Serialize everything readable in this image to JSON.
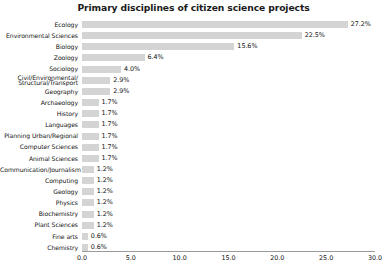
{
  "chart_data": {
    "type": "bar",
    "orientation": "horizontal",
    "title": "Primary disciplines of citizen science projects",
    "xlabel": "",
    "ylabel": "",
    "xlim": [
      0.0,
      30.0
    ],
    "xticks": [
      "0.0",
      "5.0",
      "10.0",
      "15.0",
      "20.0",
      "25.0",
      "30.0"
    ],
    "xtick_values": [
      0,
      5,
      10,
      15,
      20,
      25,
      30
    ],
    "grid": false,
    "legend": "none",
    "bar_color": "#d4d4d4",
    "categories": [
      "Ecology",
      "Environmental Sciences",
      "Biology",
      "Zoology",
      "Sociology",
      "Civil/Environmental/\nStructural/Transport",
      "Geography",
      "Archaeology",
      "History",
      "Languages",
      "Planning Urban/Regional",
      "Computer Sciences",
      "Animal Sciences",
      "Communication/Journalism",
      "Computing",
      "Geology",
      "Physics",
      "Biochemistry",
      "Plant Sciences",
      "Fine arts",
      "Chemistry"
    ],
    "values": [
      27.2,
      22.5,
      15.6,
      6.4,
      4.0,
      2.9,
      2.9,
      1.7,
      1.7,
      1.7,
      1.7,
      1.7,
      1.7,
      1.2,
      1.2,
      1.2,
      1.2,
      1.2,
      1.2,
      0.6,
      0.6
    ],
    "value_labels": [
      "27.2%",
      "22.5%",
      "15.6%",
      "6.4%",
      "4.0%",
      "2.9%",
      "2.9%",
      "1.7%",
      "1.7%",
      "1.7%",
      "1.7%",
      "1.7%",
      "1.7%",
      "1.2%",
      "1.2%",
      "1.2%",
      "1.2%",
      "1.2%",
      "1.2%",
      "0.6%",
      "0.6%"
    ]
  }
}
